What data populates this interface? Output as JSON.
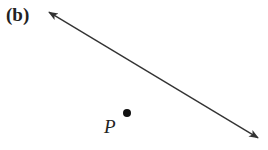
{
  "figure": {
    "panel_label": "(b)",
    "point_label": "P",
    "line": {
      "x1": 47,
      "y1": 11,
      "x2": 260,
      "y2": 139,
      "color": "#333333"
    },
    "point": {
      "cx": 127,
      "cy": 113,
      "r": 4,
      "color": "#111111"
    }
  }
}
